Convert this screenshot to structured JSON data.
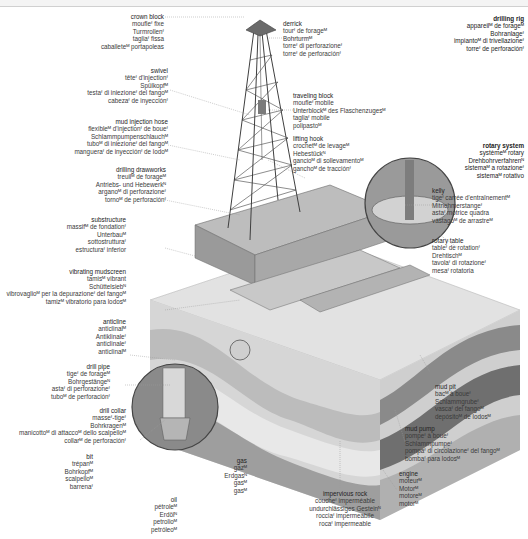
{
  "labels": {
    "drilling_rig": [
      "drilling rig",
      "appareilᴹ de forageᴹ",
      "Bohranlageᶠ",
      "impiantoᴹ di trivellazioneᶠ",
      "torreᶠ de perforaciónᶠ"
    ],
    "crown_block": [
      "crown block",
      "moufleᶠ fixe",
      "Turmrollenᶠ",
      "tagliaᶠ fissa",
      "caballeteᴹ portapoleas"
    ],
    "derrick": [
      "derrick",
      "tourᶠ de forageᴹ",
      "Bohrturmᴹ",
      "torreᶠ di perforazioneᶠ",
      "torreᶠ de perforaciónᶠ"
    ],
    "swivel": [
      "swivel",
      "têteᶠ d'injectionᶠ",
      "Spülkopfᴹ",
      "testaᶠ di iniezioneᶠ del fangoᴹ",
      "cabezaᶠ de inyecciónᶠ"
    ],
    "traveling_block": [
      "traveling block",
      "moufleᶠ mobile",
      "Unterblockᴹ des Flaschenzugesᴹ",
      "tagliaᶠ mobile",
      "polipastoᴹ"
    ],
    "mud_injection_hose": [
      "mud injection hose",
      "flexibleᴹ d'injectionᶠ de boueᶠ",
      "Schlammpumpenschlauchᴹ",
      "tuboᴹ di iniezioneᶠ del fangoᴹ",
      "mangueraᶠ de inyecciónᶠ de lodoᴹ"
    ],
    "lifting_hook": [
      "lifting hook",
      "crochetᴹ de levageᴹ",
      "Hebestückᴺ",
      "gancioᴹ di sollevamentoᴹ",
      "ganchoᴹ de tracciónᶠ"
    ],
    "rotary_system": [
      "rotary system",
      "systèmeᴹ rotary",
      "Drehbohrverfahrenᴺ",
      "sistemaᴹ a rotazioneᶠ",
      "sistemaᴹ rotativo"
    ],
    "drilling_drawworks": [
      "drilling drawworks",
      "treuilᴹ de forageᴹ",
      "Antriebs- und Hebewerkᴺ",
      "arganoᴹ di perforazioneᶠ",
      "tornoᴹ de perforaciónᶠ"
    ],
    "kelly": [
      "kelly",
      "tigeᶠ carrée d'entraînementᴹ",
      "Mitnehmerstangeᶠ",
      "astaᶠ motrice quadra",
      "vástagoᴹ de arrastreᴹ"
    ],
    "substructure": [
      "substructure",
      "massifᴹ de fondationᶠ",
      "Unterbauᴹ",
      "sottostrutturaᶠ",
      "estructuraᶠ inferior"
    ],
    "rotary_table": [
      "rotary table",
      "tableᶠ de rotationᶠ",
      "Drehtischᴹ",
      "tavolaᶠ di rotazioneᶠ",
      "mesaᶠ rotatoria"
    ],
    "vibrating_mudscreen": [
      "vibrating mudscreen",
      "tamisᴹ vibrant",
      "Schüttelsiebᴺ",
      "vibrovaglioᴹ per la depurazioneᶠ del fangoᴹ",
      "tamizᴹ vibratorio para lodosᴹ"
    ],
    "anticline": [
      "anticline",
      "anticlinalᴹ",
      "Antiklinaleᶠ",
      "anticlinaleᶠ",
      "anticlinalᴹ"
    ],
    "drill_pipe": [
      "drill pipe",
      "tigeᶠ de forageᴹ",
      "Bohrgestängeᴺ",
      "astaᶠ di perforazioneᶠ",
      "tuboᴹ de perforaciónᶠ"
    ],
    "mud_pit": [
      "mud pit",
      "bacᴹ à boueᶠ",
      "Schlammgrubeᶠ",
      "vascaᶠ del fangoᴹ",
      "depósitoᴹ de lodosᴹ"
    ],
    "drill_collar": [
      "drill collar",
      "masseᶠ-tigeᶠ",
      "Bohrkragenᴹ",
      "manicottoᴹ di attaccoᴹ dello scalpelloᴹ",
      "collarᴹ de perforaciónᶠ"
    ],
    "mud_pump": [
      "mud pump",
      "pompeᶠ à boueᶠ",
      "Schlammpumpeᶠ",
      "pompaᶠ di circolazioneᶠ del fangoᴹ",
      "bombaᶠ para lodosᴹ"
    ],
    "bit": [
      "bit",
      "trépanᴹ",
      "Bohrkopfᴹ",
      "scalpelloᴹ",
      "barrenaᶠ"
    ],
    "gas": [
      "gas",
      "gazᴹ",
      "Erdgasᴺ",
      "gasᴹ",
      "gasᴹ"
    ],
    "engine": [
      "engine",
      "moteurᴹ",
      "Motorᴹ",
      "motoreᴹ",
      "motorᴹ"
    ],
    "oil": [
      "oil",
      "pétroleᴹ",
      "Erdölᴺ",
      "petrolioᴹ",
      "petróleoᴹ"
    ],
    "impervious_rock": [
      "impervious rock",
      "coucheᶠ imperméable",
      "undurchlässiges Gesteinᴺ",
      "rocciaᶠ impermeabile",
      "rocaᶠ impermeable"
    ]
  },
  "colors": {
    "text": "#3a3a3a",
    "leader": "#9a9a9a",
    "strata_light": "#dcdcdc",
    "strata_mid": "#bdbdbd",
    "strata_dark": "#8c8c8c",
    "steel": "#5a5a5a"
  }
}
